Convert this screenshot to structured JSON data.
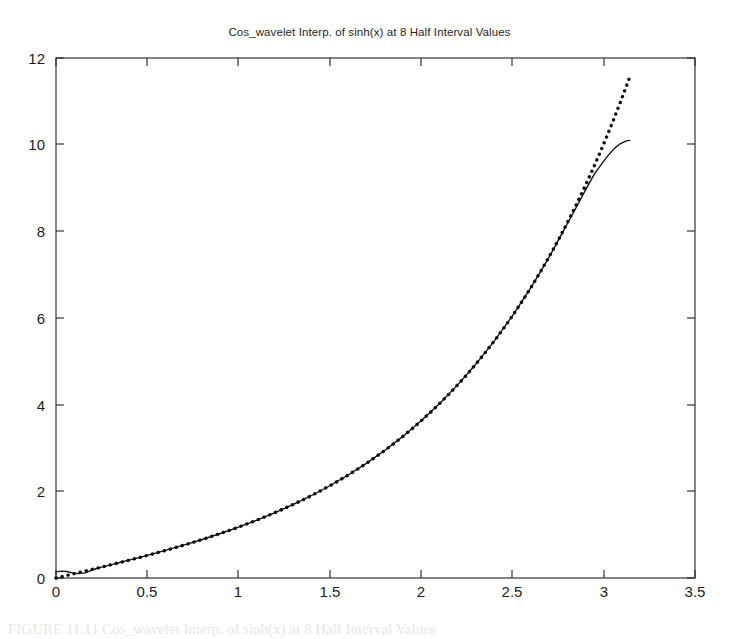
{
  "figure": {
    "title": "Cos_wavelet Interp. of sinh(x) at 8 Half Interval Values",
    "caption_partial": "FIGURE 11.11  Cos_wavelet Interp. of sinh(x) at 8 Half Interval Values"
  },
  "axes": {
    "x_ticks": [
      "0",
      "0.5",
      "1",
      "1.5",
      "2",
      "2.5",
      "3",
      "3.5"
    ],
    "y_ticks": [
      "0",
      "2",
      "4",
      "6",
      "8",
      "10",
      "12"
    ],
    "x_label": "",
    "y_label": ""
  },
  "colors": {
    "axis": "#2b2b2b",
    "curve_solid": "#111111",
    "curve_dotted": "#0d0d0d",
    "background": "#ffffff"
  },
  "chart_data": {
    "type": "line",
    "title": "Cos_wavelet Interp. of sinh(x) at 8 Half Interval Values",
    "xlabel": "",
    "ylabel": "",
    "xlim": [
      0,
      3.5
    ],
    "ylim": [
      0,
      12
    ],
    "xticks": [
      0,
      0.5,
      1,
      1.5,
      2,
      2.5,
      3,
      3.5
    ],
    "yticks": [
      0,
      2,
      4,
      6,
      8,
      10,
      12
    ],
    "grid": false,
    "legend": "none",
    "annotations": [
      "Dotted series is the true sinh(x); solid series is the cosine-wavelet interpolant.",
      "Both curves coincide from about x=0.2 through x=2.8.",
      "Near x=3.0 the interpolant rolls over and flattens, ending near y=10.1 while sinh(x) continues to about y=11.5 at x=3.14.",
      "A small overshoot wiggle appears in the interpolant just right of the origin."
    ],
    "series": [
      {
        "name": "sinh(x) exact",
        "style": "dotted",
        "x": [
          0.0,
          0.05,
          0.1,
          0.15,
          0.2,
          0.25,
          0.3,
          0.35,
          0.4,
          0.45,
          0.5,
          0.55,
          0.6,
          0.65,
          0.7,
          0.75,
          0.8,
          0.85,
          0.9,
          0.95,
          1.0,
          1.05,
          1.1,
          1.15,
          1.2,
          1.25,
          1.3,
          1.35,
          1.4,
          1.45,
          1.5,
          1.55,
          1.6,
          1.65,
          1.7,
          1.75,
          1.8,
          1.85,
          1.9,
          1.95,
          2.0,
          2.05,
          2.1,
          2.15,
          2.2,
          2.25,
          2.3,
          2.35,
          2.4,
          2.45,
          2.5,
          2.55,
          2.6,
          2.65,
          2.7,
          2.75,
          2.8,
          2.85,
          2.9,
          2.95,
          3.0,
          3.05,
          3.1,
          3.1416
        ],
        "y": [
          0.0,
          0.05,
          0.1002,
          0.1506,
          0.2013,
          0.2526,
          0.3045,
          0.3572,
          0.4108,
          0.4653,
          0.5211,
          0.5782,
          0.6367,
          0.6967,
          0.7586,
          0.8223,
          0.8881,
          0.9561,
          1.0265,
          1.0995,
          1.1752,
          1.2539,
          1.3356,
          1.4208,
          1.5095,
          1.6019,
          1.6984,
          1.7991,
          1.9043,
          2.0143,
          2.1293,
          2.2496,
          2.3756,
          2.5075,
          2.6456,
          2.7904,
          2.9422,
          3.1013,
          3.2682,
          3.4432,
          3.6269,
          3.8196,
          4.0219,
          4.2342,
          4.4571,
          4.6912,
          4.937,
          5.1951,
          5.4662,
          5.751,
          6.0502,
          6.3645,
          6.6947,
          7.0417,
          7.4063,
          7.7894,
          8.1919,
          8.615,
          9.0596,
          9.5268,
          10.0179,
          10.534,
          11.0765,
          11.5487
        ]
      },
      {
        "name": "Cos_wavelet interpolant",
        "style": "solid",
        "x": [
          0.0,
          0.03,
          0.06,
          0.09,
          0.12,
          0.16,
          0.2,
          0.25,
          0.3,
          0.35,
          0.4,
          0.45,
          0.5,
          0.6,
          0.7,
          0.8,
          0.9,
          1.0,
          1.1,
          1.2,
          1.3,
          1.4,
          1.5,
          1.6,
          1.7,
          1.8,
          1.9,
          2.0,
          2.1,
          2.2,
          2.3,
          2.4,
          2.5,
          2.6,
          2.65,
          2.7,
          2.75,
          2.8,
          2.85,
          2.9,
          2.95,
          3.0,
          3.03,
          3.06,
          3.09,
          3.12,
          3.1416
        ],
        "y": [
          0.14,
          0.16,
          0.15,
          0.12,
          0.1,
          0.12,
          0.19,
          0.25,
          0.305,
          0.357,
          0.411,
          0.465,
          0.521,
          0.637,
          0.759,
          0.888,
          1.027,
          1.175,
          1.336,
          1.51,
          1.698,
          1.904,
          2.129,
          2.376,
          2.646,
          2.942,
          3.268,
          3.627,
          4.022,
          4.457,
          4.937,
          5.466,
          6.05,
          6.695,
          7.04,
          7.4,
          7.78,
          8.17,
          8.56,
          8.95,
          9.33,
          9.62,
          9.78,
          9.92,
          10.02,
          10.08,
          10.1
        ]
      }
    ]
  }
}
